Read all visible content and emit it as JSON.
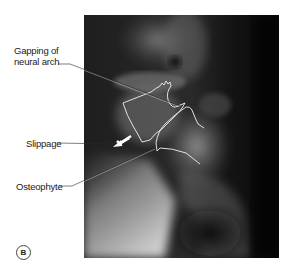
{
  "figure": {
    "panel_label": "B",
    "image_kind": "lateral lumbar x-ray",
    "annotations": [
      {
        "id": "gapping",
        "lines": [
          "Gapping of",
          "neural arch"
        ]
      },
      {
        "id": "slippage",
        "lines": [
          "Slippage"
        ]
      },
      {
        "id": "osteophyte",
        "lines": [
          "Osteophyte"
        ]
      }
    ]
  },
  "colors": {
    "outline": "#f2f2f2",
    "leader_line": "#2a2a2a",
    "text": "#222222",
    "xray_dark": "#0e0e0e",
    "xray_light": "#d8d8d8"
  }
}
